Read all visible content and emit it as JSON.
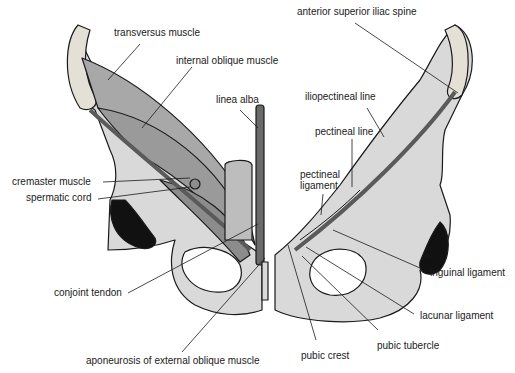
{
  "figure": {
    "colors": {
      "bone": "#d9d9d9",
      "bone_dark": "#bdbdbd",
      "muscle": "#a8a8a8",
      "muscle_dark": "#8c8c8c",
      "cavity": "#111111",
      "outline": "#1a1a1a",
      "leader": "#1a1a1a"
    },
    "artist_mark": "GL",
    "labels": {
      "transversus_muscle": "transversus muscle",
      "internal_oblique_muscle": "internal oblique muscle",
      "linea_alba": "linea alba",
      "cremaster_muscle": "cremaster muscle",
      "spermatic_cord": "spermatic cord",
      "conjoint_tendon": "conjoint tendon",
      "aponeurosis_external_oblique": "aponeurosis of external oblique muscle",
      "anterior_superior_iliac_spine": "anterior superior iliac spine",
      "iliopectineal_line": "iliopectineal line",
      "pectineal_line": "pectineal line",
      "pectineal_ligament": "pectineal ligament",
      "inguinal_ligament": "inguinal ligament",
      "lacunar_ligament": "lacunar ligament",
      "pubic_tubercle": "pubic tubercle",
      "pubic_crest": "pubic crest"
    }
  }
}
